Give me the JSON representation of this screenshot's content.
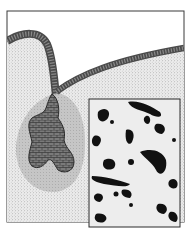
{
  "image": {
    "description": "Scientific illustration of a tubular gland: a cellular duct curving from the upper left, joining a long duct running to the upper right, leading down into a lobed secretory body surrounded by a pale halo, with a micrograph inset at the lower right showing dark stained cell clusters.",
    "colors": {
      "background": "#ffffff",
      "stipple_field": "#e4e4e4",
      "frame": "#333333",
      "duct": "#555555",
      "duct_cells": "#2a2a2a",
      "halo": "#bdbdbd",
      "gland_body": "#6a6a6a",
      "inset_background": "#ececec",
      "inset_stain": "#0e0e0e"
    },
    "elements": [
      "outer-frame",
      "stippled-tissue",
      "curved-duct",
      "long-duct",
      "gland-halo",
      "gland-body",
      "micrograph-inset"
    ]
  }
}
